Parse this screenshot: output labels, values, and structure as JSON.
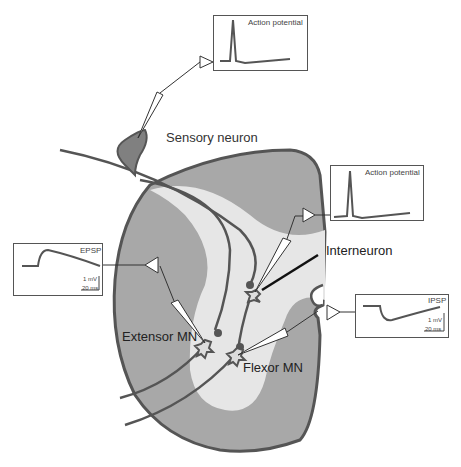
{
  "labels": {
    "sensory_neuron": "Sensory neuron",
    "interneuron": "Interneuron",
    "extensor_mn": "Extensor MN",
    "flexor_mn": "Flexor MN"
  },
  "recordings": {
    "sensory": {
      "title": "Action potential"
    },
    "interneuron": {
      "title": "Action potential"
    },
    "extensor": {
      "title": "EPSP",
      "scale_v": "1 mV",
      "scale_t": "20 ms"
    },
    "flexor": {
      "title": "IPSP",
      "scale_v": "1 mV",
      "scale_t": "20 ms"
    }
  },
  "colors": {
    "gray_matter_outer": "#a8a8a8",
    "gray_matter_inner": "#e6e6e6",
    "outline": "#555555",
    "soma": "#808080",
    "trace": "#555555"
  }
}
